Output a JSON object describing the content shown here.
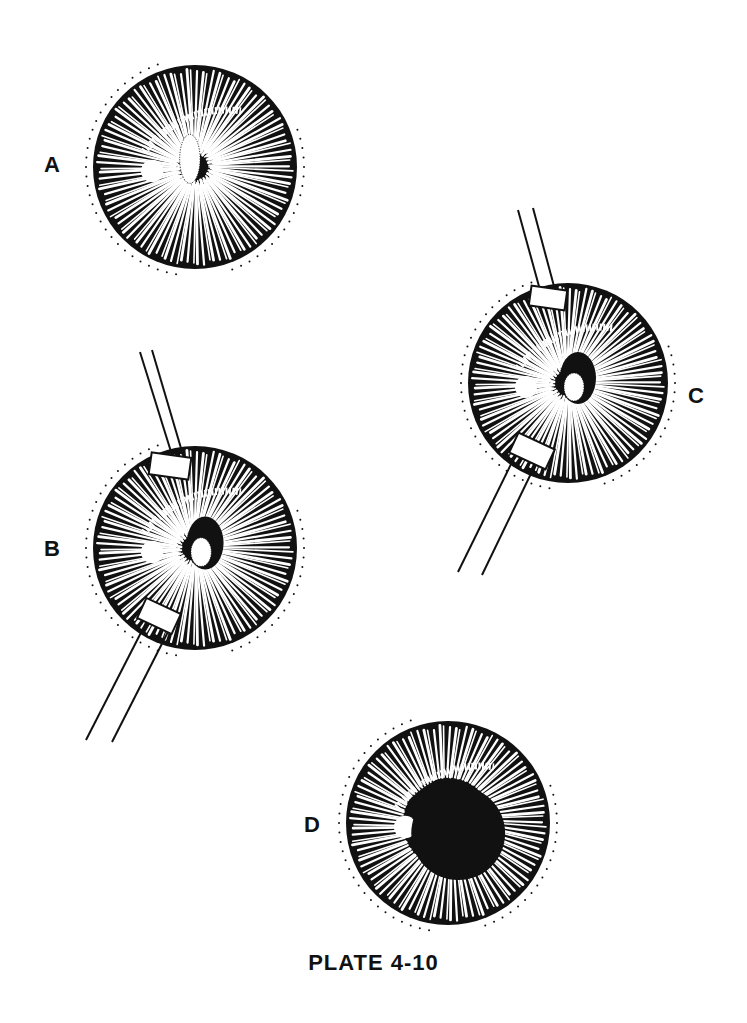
{
  "plate": {
    "caption": "PLATE 4-10"
  },
  "panels": [
    {
      "id": "A",
      "label": "A",
      "instruments": 0,
      "pupil": "small-irregular-dotted"
    },
    {
      "id": "B",
      "label": "B",
      "instruments": 2,
      "pupil": "irregular-dark-with-dotted-mass"
    },
    {
      "id": "C",
      "label": "C",
      "instruments": 2,
      "pupil": "irregular-dark-with-dotted-mass"
    },
    {
      "id": "D",
      "label": "D",
      "instruments": 0,
      "pupil": "round-dark-dilated"
    }
  ],
  "colors": {
    "ink": "#111111",
    "paper": "#ffffff"
  }
}
